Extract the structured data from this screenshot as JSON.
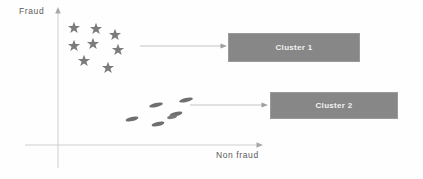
{
  "figure": {
    "background_color": "#fefefe",
    "axes": {
      "y_axis_label": "Fraud",
      "x_axis_label": "Non fraud",
      "axis_color": "#c9c9c9",
      "origin": {
        "x": 58,
        "y": 145
      },
      "y_axis_top": 10,
      "y_axis_bottom": 168,
      "x_axis_left": 25,
      "x_axis_right": 262
    },
    "clusters": [
      {
        "id": "cluster-1",
        "box_label": "Cluster 1",
        "marker": "star",
        "marker_color": "#7b7b7b",
        "box_color": "#878787",
        "box_text_color": "#f2f2f2",
        "points": [
          {
            "x": 74,
            "y": 27
          },
          {
            "x": 96,
            "y": 28
          },
          {
            "x": 115,
            "y": 34
          },
          {
            "x": 74,
            "y": 45
          },
          {
            "x": 93,
            "y": 43
          },
          {
            "x": 118,
            "y": 49
          },
          {
            "x": 84,
            "y": 60
          },
          {
            "x": 108,
            "y": 67
          }
        ],
        "connector": {
          "x1": 140,
          "y1": 46,
          "x2": 226,
          "y2": 46
        }
      },
      {
        "id": "cluster-2",
        "box_label": "Cluster 2",
        "marker": "ellipse",
        "marker_color": "#6f6f6f",
        "box_color": "#878787",
        "box_text_color": "#f2f2f2",
        "points": [
          {
            "x": 156,
            "y": 105
          },
          {
            "x": 186,
            "y": 100
          },
          {
            "x": 176,
            "y": 114
          },
          {
            "x": 132,
            "y": 119
          },
          {
            "x": 158,
            "y": 124
          },
          {
            "x": 172,
            "y": 117
          }
        ],
        "connector": {
          "x1": 190,
          "y1": 105,
          "x2": 267,
          "y2": 105
        }
      }
    ],
    "connector_color": "#b4b4b4"
  }
}
